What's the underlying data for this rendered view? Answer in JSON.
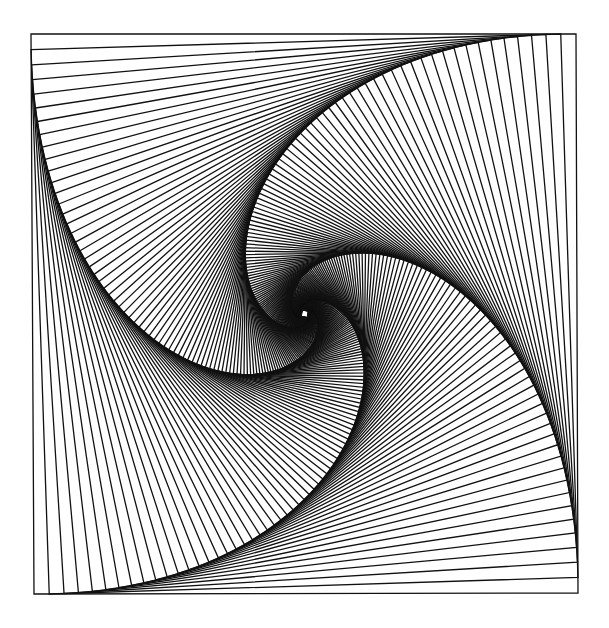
{
  "artwork": {
    "type": "nested-rotating-squares",
    "description": "Whirl spiral of nested squares, each rotated by stepping vertices a fixed fraction along the previous square's edges",
    "canvas": {
      "width": 609,
      "height": 628,
      "background": "#ffffff"
    },
    "outer_square": {
      "top_left": [
        31,
        34
      ],
      "top_right": [
        576,
        34
      ],
      "bottom_right": [
        578,
        593
      ],
      "bottom_left": [
        34,
        594
      ]
    },
    "step_fraction": 0.028,
    "iterations": 160,
    "min_size_px": 3,
    "stroke_color": "#111111",
    "stroke_width": 1.3
  }
}
